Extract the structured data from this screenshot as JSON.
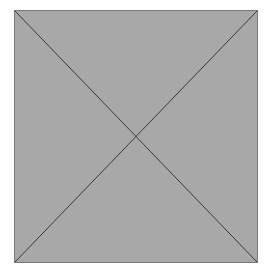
{
  "placeholder": {
    "icon": "image-placeholder-icon",
    "fill_color": "#a8a8a8",
    "stroke_color": "#3a3a3a",
    "border_color": "#7a7a7a"
  }
}
